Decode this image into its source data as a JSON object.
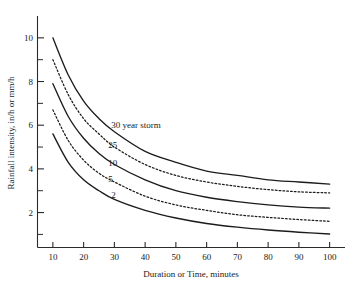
{
  "figure": {
    "background_color": "#ffffff",
    "ink_color": "#1c1c1c"
  },
  "chart_data": {
    "type": "line",
    "title": "",
    "subtitle": "",
    "xlabel": "Duration or Time, minutes",
    "ylabel": "Rainfall intensity, in/h or mm/h",
    "xlim": [
      5,
      105
    ],
    "ylim": [
      0.4,
      11.0
    ],
    "grid": false,
    "legend_position": "inline-curve-labels",
    "xticks": [
      10,
      20,
      30,
      40,
      50,
      60,
      70,
      80,
      90,
      100
    ],
    "xtick_labels": [
      "10",
      "20",
      "30",
      "40",
      "50",
      "60",
      "70",
      "80",
      "90",
      "100"
    ],
    "yticks": [
      2,
      4,
      6,
      8,
      10
    ],
    "ytick_labels": [
      "2",
      "4",
      "6",
      "8",
      "10"
    ],
    "yticks_minor": [
      1,
      3,
      5,
      7,
      9
    ],
    "x": [
      10,
      15,
      20,
      25,
      30,
      40,
      50,
      60,
      70,
      80,
      90,
      100
    ],
    "series": [
      {
        "name": "30 year storm",
        "label": "30 year storm",
        "style": "solid",
        "values": [
          10.0,
          8.3,
          7.1,
          6.3,
          5.7,
          4.8,
          4.3,
          3.9,
          3.7,
          3.5,
          3.4,
          3.3
        ]
      },
      {
        "name": "25",
        "label": "25",
        "style": "dotted",
        "values": [
          9.0,
          7.4,
          6.3,
          5.6,
          5.0,
          4.2,
          3.7,
          3.4,
          3.2,
          3.05,
          2.95,
          2.9
        ]
      },
      {
        "name": "10",
        "label": "10",
        "style": "solid",
        "values": [
          7.9,
          6.4,
          5.4,
          4.7,
          4.2,
          3.5,
          3.0,
          2.7,
          2.5,
          2.35,
          2.25,
          2.2
        ]
      },
      {
        "name": "5",
        "label": "5",
        "style": "dotted",
        "values": [
          6.7,
          5.3,
          4.4,
          3.8,
          3.4,
          2.75,
          2.35,
          2.1,
          1.9,
          1.78,
          1.68,
          1.6
        ]
      },
      {
        "name": "2",
        "label": "2",
        "style": "solid",
        "values": [
          5.6,
          4.3,
          3.5,
          3.0,
          2.6,
          2.1,
          1.75,
          1.5,
          1.33,
          1.2,
          1.1,
          1.02
        ]
      }
    ],
    "annotations": [
      {
        "text": "30 year storm",
        "x": 29,
        "y": 5.85
      },
      {
        "text": "25",
        "x": 28,
        "y": 4.95
      },
      {
        "text": "10",
        "x": 28,
        "y": 4.15
      },
      {
        "text": "5",
        "x": 28,
        "y": 3.4
      },
      {
        "text": "2",
        "x": 29,
        "y": 2.65
      }
    ]
  }
}
